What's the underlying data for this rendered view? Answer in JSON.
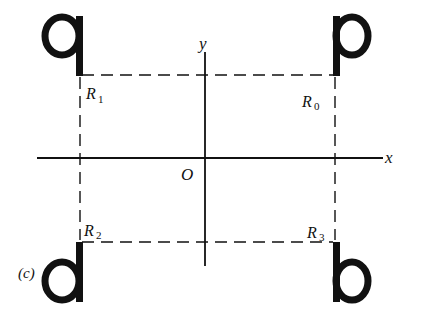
{
  "figure": {
    "panel_label": "(c)",
    "axes": {
      "x_label": "x",
      "y_label": "y",
      "origin_label": "O"
    },
    "letters": [
      {
        "id": "q",
        "char": "q",
        "quadrant": "top-left"
      },
      {
        "id": "p",
        "char": "p",
        "quadrant": "top-right"
      },
      {
        "id": "d",
        "char": "d",
        "quadrant": "bottom-left"
      },
      {
        "id": "b",
        "char": "b",
        "quadrant": "bottom-right"
      }
    ],
    "points": [
      {
        "name": "R",
        "sub": "0",
        "position": "top-right"
      },
      {
        "name": "R",
        "sub": "1",
        "position": "top-left"
      },
      {
        "name": "R",
        "sub": "2",
        "position": "bottom-left"
      },
      {
        "name": "R",
        "sub": "3",
        "position": "bottom-right"
      }
    ],
    "stroke_color": "#111111",
    "background": "#ffffff"
  }
}
